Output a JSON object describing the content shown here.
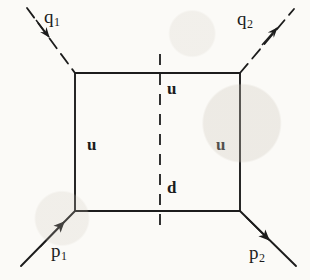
{
  "figure": {
    "type": "feynman-diagram",
    "background_color": "#fbfaf7",
    "line_color": "#1c1c1c"
  },
  "external_lines": [
    {
      "id": "q1",
      "label": "q",
      "subscript": "1",
      "style": "dashed",
      "role": "incoming",
      "arrow_direction": "into-vertex",
      "x1": 27,
      "y1": 8,
      "x2": 75,
      "y2": 73,
      "label_x": 44,
      "label_y": 7,
      "arrow_x": 45,
      "arrow_y": 31
    },
    {
      "id": "q2",
      "label": "q",
      "subscript": "2",
      "style": "dashed",
      "role": "outgoing",
      "arrow_direction": "away-from-vertex",
      "x1": 240,
      "y1": 73,
      "x2": 294,
      "y2": 9,
      "label_x": 237,
      "label_y": 9,
      "arrow_x": 273,
      "arrow_y": 35
    },
    {
      "id": "p1",
      "label": "p",
      "subscript": "1",
      "style": "solid",
      "role": "incoming",
      "arrow_direction": "into-vertex",
      "x1": 21,
      "y1": 266,
      "x2": 75,
      "y2": 211,
      "label_x": 51,
      "label_y": 241,
      "arrow_x": 60,
      "arrow_y": 226
    },
    {
      "id": "p2",
      "label": "p",
      "subscript": "2",
      "style": "solid",
      "role": "outgoing",
      "arrow_direction": "away-from-vertex",
      "x1": 240,
      "y1": 211,
      "x2": 296,
      "y2": 266,
      "label_x": 249,
      "label_y": 243,
      "arrow_x": 265,
      "arrow_y": 236
    }
  ],
  "box": {
    "left": 75,
    "top": 73,
    "right": 240,
    "bottom": 211,
    "style": "solid"
  },
  "cut_line": {
    "id": "unitarity-cut",
    "style": "dashed",
    "orientation": "vertical",
    "x": 160,
    "y1": 54,
    "y2": 233
  },
  "internal_labels": [
    {
      "id": "u-top",
      "text": "u",
      "x": 167,
      "y": 80
    },
    {
      "id": "u-left",
      "text": "u",
      "x": 87,
      "y": 136
    },
    {
      "id": "u-right",
      "text": "u",
      "x": 216,
      "y": 136
    },
    {
      "id": "d-bottom",
      "text": "d",
      "x": 167,
      "y": 179
    }
  ]
}
